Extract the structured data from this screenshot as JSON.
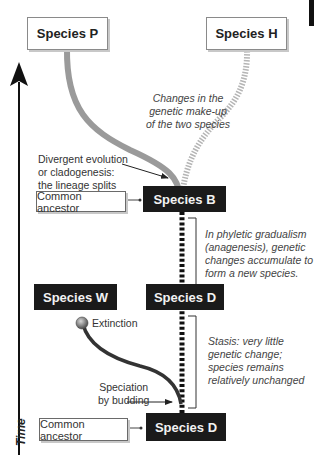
{
  "species": {
    "p": "Species P",
    "h": "Species H",
    "b": "Species B",
    "w": "Species W",
    "d_mid": "Species D",
    "d_bottom": "Species D"
  },
  "labels": {
    "common_ancestor_top": "Common ancestor",
    "common_ancestor_bottom": "Common ancestor",
    "time": "Time"
  },
  "notes": {
    "changes": [
      "Changes in the",
      "genetic make-up",
      "of the two species"
    ],
    "divergent": [
      "Divergent evolution",
      "or cladogenesis:",
      "the lineage splits"
    ],
    "phyletic": [
      "In phyletic gradualism",
      "(anagenesis), genetic",
      "changes accumulate to",
      "form a new species."
    ],
    "extinction": "Extinction",
    "stasis": [
      "Stasis: very little",
      "genetic change;",
      "species remains",
      "relatively unchanged"
    ],
    "budding": [
      "Speciation",
      "by budding"
    ]
  },
  "colors": {
    "dark_box": "#1a1a1a",
    "lineage_p": "#9a9a9a",
    "lineage_h": "#b0b0b0",
    "lineage_w": "#333333",
    "extinction_ball": "#777777"
  }
}
